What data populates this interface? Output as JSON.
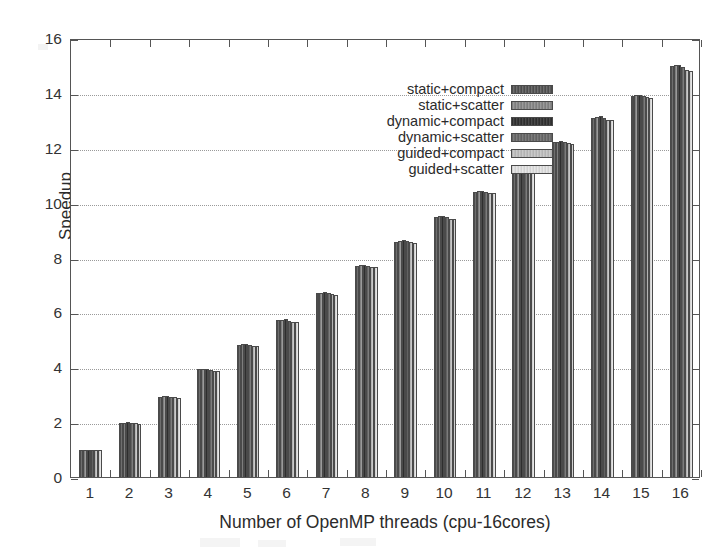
{
  "chart_data": {
    "type": "bar",
    "title": "",
    "xlabel": "Number of OpenMP threads (cpu-16cores)",
    "ylabel": "Speedup",
    "categories": [
      "1",
      "2",
      "3",
      "4",
      "5",
      "6",
      "7",
      "8",
      "9",
      "10",
      "11",
      "12",
      "13",
      "14",
      "15",
      "16"
    ],
    "ylim": [
      0,
      16
    ],
    "yticks": [
      0,
      2,
      4,
      6,
      8,
      10,
      12,
      14,
      16
    ],
    "grid": true,
    "grid_axis": "y",
    "legend_position": "top-right inside",
    "series": [
      {
        "name": "static+compact",
        "color": "#5a5a5a",
        "values": [
          1.0,
          1.98,
          2.93,
          3.92,
          4.82,
          5.72,
          6.7,
          7.7,
          8.58,
          9.48,
          10.38,
          11.32,
          12.2,
          13.1,
          13.9,
          14.98
        ]
      },
      {
        "name": "static+scatter",
        "color": "#888888",
        "values": [
          1.0,
          1.98,
          2.94,
          3.93,
          4.84,
          5.74,
          6.72,
          7.72,
          8.62,
          9.5,
          10.42,
          11.35,
          12.22,
          13.12,
          13.92,
          15.0
        ]
      },
      {
        "name": "dynamic+compact",
        "color": "#383838",
        "values": [
          1.0,
          1.99,
          2.95,
          3.94,
          4.86,
          5.76,
          6.74,
          7.74,
          8.64,
          9.52,
          10.44,
          11.38,
          12.24,
          13.14,
          13.94,
          15.02
        ]
      },
      {
        "name": "dynamic+scatter",
        "color": "#6c6c6c",
        "values": [
          1.0,
          1.97,
          2.92,
          3.9,
          4.82,
          5.7,
          6.7,
          7.7,
          8.6,
          9.46,
          10.4,
          11.32,
          12.2,
          13.08,
          13.88,
          14.96
        ]
      },
      {
        "name": "guided+compact",
        "color": "#bdbdbd",
        "values": [
          1.0,
          1.96,
          2.9,
          3.88,
          4.78,
          5.66,
          6.66,
          7.66,
          8.56,
          9.42,
          10.36,
          11.28,
          12.16,
          13.02,
          13.84,
          14.82
        ]
      },
      {
        "name": "guided+scatter",
        "color": "#dcdcdc",
        "values": [
          1.0,
          1.95,
          2.88,
          3.86,
          4.76,
          5.64,
          6.64,
          7.64,
          8.54,
          9.4,
          10.34,
          11.26,
          12.14,
          13.0,
          13.8,
          14.78
        ]
      }
    ]
  },
  "axis": {
    "y_title": "Speedup",
    "x_title": "Number of OpenMP threads (cpu-16cores)",
    "y_tick_labels": [
      "0",
      "2",
      "4",
      "6",
      "8",
      "10",
      "12",
      "14",
      "16"
    ],
    "x_tick_labels": [
      "1",
      "2",
      "3",
      "4",
      "5",
      "6",
      "7",
      "8",
      "9",
      "10",
      "11",
      "12",
      "13",
      "14",
      "15",
      "16"
    ]
  },
  "legend": {
    "entries": [
      {
        "label": "static+compact"
      },
      {
        "label": "static+scatter"
      },
      {
        "label": "dynamic+compact"
      },
      {
        "label": "dynamic+scatter"
      },
      {
        "label": "guided+compact"
      },
      {
        "label": "guided+scatter"
      }
    ]
  }
}
